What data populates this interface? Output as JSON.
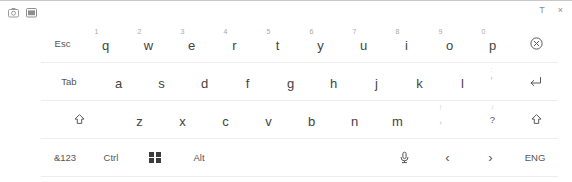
{
  "window": {
    "titlebar": {
      "left_icons": [
        {
          "name": "keyboard-layout-icon",
          "glyph": "camera"
        },
        {
          "name": "keyboard-dock-icon",
          "glyph": "window"
        }
      ],
      "right_icons": [
        {
          "name": "resize-handle-icon",
          "label": "T"
        },
        {
          "name": "close-icon",
          "label": "×"
        }
      ]
    },
    "accent_color": "#3c3c3c",
    "separator_color": "#ededed",
    "text_color": "#434343"
  },
  "keyboard": {
    "rows": [
      {
        "name": "row-qwerty",
        "keys": [
          {
            "name": "key-esc",
            "label": "Esc",
            "sup": "",
            "type": "mod",
            "x": 41,
            "w": 43
          },
          {
            "name": "key-q",
            "label": "q",
            "sup": "1",
            "type": "letter",
            "x": 84,
            "w": 43
          },
          {
            "name": "key-w",
            "label": "w",
            "sup": "2",
            "type": "letter",
            "x": 127,
            "w": 43
          },
          {
            "name": "key-e",
            "label": "e",
            "sup": "3",
            "type": "letter",
            "x": 170,
            "w": 43
          },
          {
            "name": "key-r",
            "label": "r",
            "sup": "4",
            "type": "letter",
            "x": 213,
            "w": 43
          },
          {
            "name": "key-t",
            "label": "t",
            "sup": "5",
            "type": "letter",
            "x": 256,
            "w": 43
          },
          {
            "name": "key-y",
            "label": "y",
            "sup": "6",
            "type": "letter",
            "x": 299,
            "w": 43
          },
          {
            "name": "key-u",
            "label": "u",
            "sup": "7",
            "type": "letter",
            "x": 342,
            "w": 43
          },
          {
            "name": "key-i",
            "label": "i",
            "sup": "8",
            "type": "letter",
            "x": 385,
            "w": 43
          },
          {
            "name": "key-o",
            "label": "o",
            "sup": "9",
            "type": "letter",
            "x": 428,
            "w": 43
          },
          {
            "name": "key-p",
            "label": "p",
            "sup": "0",
            "type": "letter",
            "x": 471,
            "w": 43
          },
          {
            "name": "key-backspace",
            "label": "",
            "sup": "",
            "type": "icon-backspace",
            "x": 514,
            "w": 44
          }
        ]
      },
      {
        "name": "row-asdf",
        "keys": [
          {
            "name": "key-tab",
            "label": "Tab",
            "sup": "",
            "type": "mod",
            "x": 41,
            "w": 56
          },
          {
            "name": "key-a",
            "label": "a",
            "sup": "",
            "type": "letter",
            "x": 97,
            "w": 43
          },
          {
            "name": "key-s",
            "label": "s",
            "sup": "",
            "type": "letter",
            "x": 140,
            "w": 43
          },
          {
            "name": "key-d",
            "label": "d",
            "sup": "",
            "type": "letter",
            "x": 183,
            "w": 43
          },
          {
            "name": "key-f",
            "label": "f",
            "sup": "",
            "type": "letter",
            "x": 226,
            "w": 43
          },
          {
            "name": "key-g",
            "label": "g",
            "sup": "",
            "type": "letter",
            "x": 269,
            "w": 43
          },
          {
            "name": "key-h",
            "label": "h",
            "sup": "",
            "type": "letter",
            "x": 312,
            "w": 43
          },
          {
            "name": "key-j",
            "label": "j",
            "sup": "",
            "type": "letter",
            "x": 355,
            "w": 43
          },
          {
            "name": "key-k",
            "label": "k",
            "sup": "",
            "type": "letter",
            "x": 398,
            "w": 43
          },
          {
            "name": "key-l",
            "label": "l",
            "sup": "",
            "type": "letter",
            "x": 441,
            "w": 43
          },
          {
            "name": "key-apostrophe",
            "label": "'",
            "sup": ":",
            "type": "faint",
            "x": 470,
            "w": 43
          },
          {
            "name": "key-enter",
            "label": "",
            "sup": "",
            "type": "icon-enter",
            "x": 513,
            "w": 45
          }
        ]
      },
      {
        "name": "row-zxcv",
        "keys": [
          {
            "name": "key-shift-left",
            "label": "",
            "sup": "",
            "type": "icon-shift",
            "x": 41,
            "w": 77
          },
          {
            "name": "key-z",
            "label": "z",
            "sup": "",
            "type": "letter",
            "x": 118,
            "w": 43
          },
          {
            "name": "key-x",
            "label": "x",
            "sup": "",
            "type": "letter",
            "x": 161,
            "w": 43
          },
          {
            "name": "key-c",
            "label": "c",
            "sup": "",
            "type": "letter",
            "x": 204,
            "w": 43
          },
          {
            "name": "key-v",
            "label": "v",
            "sup": "",
            "type": "letter",
            "x": 247,
            "w": 43
          },
          {
            "name": "key-b",
            "label": "b",
            "sup": "",
            "type": "letter",
            "x": 290,
            "w": 43
          },
          {
            "name": "key-n",
            "label": "n",
            "sup": "",
            "type": "letter",
            "x": 333,
            "w": 43
          },
          {
            "name": "key-m",
            "label": "m",
            "sup": "",
            "type": "letter",
            "x": 376,
            "w": 43
          },
          {
            "name": "key-comma",
            "label": ",",
            "sup": "!",
            "type": "faint",
            "x": 419,
            "w": 43
          },
          {
            "name": "key-period",
            "label": ".",
            "sup": "'",
            "type": "faint",
            "x": 462,
            "w": 43
          },
          {
            "name": "key-question",
            "label": "?",
            "sup": "/",
            "type": "mod",
            "x": 471,
            "w": 43
          },
          {
            "name": "key-shift-right",
            "label": "",
            "sup": "",
            "type": "icon-shift",
            "x": 514,
            "w": 44
          }
        ]
      },
      {
        "name": "row-bottom",
        "keys": [
          {
            "name": "key-symbols",
            "label": "&123",
            "sup": "",
            "type": "mod",
            "x": 41,
            "w": 48
          },
          {
            "name": "key-ctrl",
            "label": "Ctrl",
            "sup": "",
            "type": "mod",
            "x": 89,
            "w": 44
          },
          {
            "name": "key-windows",
            "label": "",
            "sup": "",
            "type": "icon-windows",
            "x": 133,
            "w": 44
          },
          {
            "name": "key-alt",
            "label": "Alt",
            "sup": "",
            "type": "mod",
            "x": 177,
            "w": 44
          },
          {
            "name": "key-space",
            "label": "",
            "sup": "",
            "type": "space",
            "x": 221,
            "w": 162
          },
          {
            "name": "key-microphone",
            "label": "",
            "sup": "",
            "type": "icon-mic",
            "x": 383,
            "w": 43
          },
          {
            "name": "key-arrow-left",
            "label": "‹",
            "sup": "",
            "type": "arrow",
            "x": 426,
            "w": 43
          },
          {
            "name": "key-arrow-right",
            "label": "›",
            "sup": "",
            "type": "arrow",
            "x": 469,
            "w": 43
          },
          {
            "name": "key-language",
            "label": "ENG",
            "sup": "",
            "type": "mod",
            "x": 512,
            "w": 46
          }
        ]
      }
    ]
  }
}
